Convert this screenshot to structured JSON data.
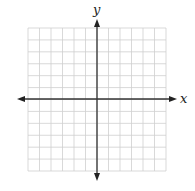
{
  "diagram": {
    "type": "coordinate-plane",
    "x_label": "x",
    "y_label": "y",
    "grid": {
      "columns": 12,
      "rows": 12,
      "left": 28,
      "top": 28,
      "right": 166,
      "bottom": 171
    },
    "origin": {
      "x": 97,
      "y": 99
    },
    "colors": {
      "grid": "#cfcfcf",
      "axis": "#333333",
      "background": "#ffffff"
    }
  }
}
